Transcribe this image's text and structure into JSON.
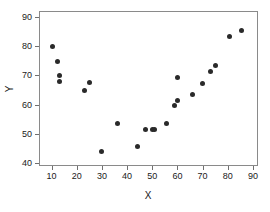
{
  "chart_data": {
    "type": "scatter",
    "title": "",
    "xlabel": "X",
    "ylabel": "Y",
    "xlim": [
      5,
      92
    ],
    "ylim": [
      39,
      92
    ],
    "xticks": [
      10,
      20,
      30,
      40,
      50,
      60,
      70,
      80,
      90
    ],
    "xticklabels": [
      "10",
      "20",
      "30",
      "40",
      "50",
      "60",
      "70",
      "80",
      "90"
    ],
    "yticks": [
      40,
      50,
      60,
      70,
      80,
      90
    ],
    "yticklabels": [
      "40",
      "50",
      "60",
      "70",
      "80",
      "90"
    ],
    "grid": false,
    "legend": false,
    "marker": "filled-circle",
    "marker_color": "#2a2a2a",
    "frame_color": "#8a8a8a",
    "background": "#ffffff",
    "points": [
      {
        "x": 10.5,
        "y": 79.8
      },
      {
        "x": 12.5,
        "y": 74.7
      },
      {
        "x": 13.0,
        "y": 70.0
      },
      {
        "x": 13.0,
        "y": 67.8
      },
      {
        "x": 23.0,
        "y": 64.7
      },
      {
        "x": 25.0,
        "y": 67.6
      },
      {
        "x": 30.0,
        "y": 43.9
      },
      {
        "x": 36.0,
        "y": 53.6
      },
      {
        "x": 44.0,
        "y": 45.7
      },
      {
        "x": 47.5,
        "y": 51.6
      },
      {
        "x": 50.0,
        "y": 51.4
      },
      {
        "x": 51.0,
        "y": 51.4
      },
      {
        "x": 55.5,
        "y": 53.5
      },
      {
        "x": 59.0,
        "y": 59.6
      },
      {
        "x": 60.0,
        "y": 61.5
      },
      {
        "x": 60.0,
        "y": 69.4
      },
      {
        "x": 66.0,
        "y": 63.5
      },
      {
        "x": 70.0,
        "y": 67.3
      },
      {
        "x": 73.0,
        "y": 71.2
      },
      {
        "x": 75.0,
        "y": 73.3
      },
      {
        "x": 80.5,
        "y": 83.2
      },
      {
        "x": 85.5,
        "y": 85.2
      }
    ]
  }
}
